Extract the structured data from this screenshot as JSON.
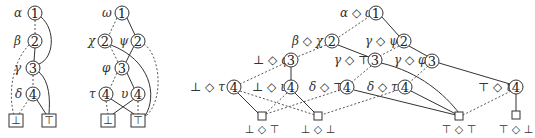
{
  "diagrams": [
    {
      "name": "left",
      "nodes": [
        {
          "id": "l1",
          "num": "1",
          "label": "α"
        },
        {
          "id": "l2",
          "num": "2",
          "label": "β"
        },
        {
          "id": "l3",
          "num": "3",
          "label": "γ"
        },
        {
          "id": "l4",
          "num": "4",
          "label": "δ"
        }
      ],
      "leaves": [
        {
          "id": "lbot",
          "symbol": "⊥"
        },
        {
          "id": "ltop",
          "symbol": "⊤"
        }
      ]
    },
    {
      "name": "middle",
      "nodes": [
        {
          "id": "m1",
          "num": "1",
          "label": "ω"
        },
        {
          "id": "m2a",
          "num": "2",
          "label": "χ"
        },
        {
          "id": "m2b",
          "num": "2",
          "label": "ψ"
        },
        {
          "id": "m3",
          "num": "3",
          "label": "φ"
        },
        {
          "id": "m4a",
          "num": "4",
          "label": "τ"
        },
        {
          "id": "m4b",
          "num": "4",
          "label": "υ"
        }
      ],
      "leaves": [
        {
          "id": "mbot",
          "symbol": "⊥"
        },
        {
          "id": "mtop",
          "symbol": "⊤"
        }
      ]
    },
    {
      "name": "right-product",
      "nodes": [
        {
          "id": "r1",
          "num": "1",
          "label": "α ◇ ω"
        },
        {
          "id": "r2a",
          "num": "2",
          "label": "β ◇ χ"
        },
        {
          "id": "r2b",
          "num": "2",
          "label": "γ ◇ ψ"
        },
        {
          "id": "r3a",
          "num": "3",
          "label": "⊥ ◇ φ"
        },
        {
          "id": "r3b",
          "num": "3",
          "label": "γ ◇ ⊤"
        },
        {
          "id": "r3c",
          "num": "3",
          "label": "γ ◇ φ"
        },
        {
          "id": "r4a",
          "num": "4",
          "label": "⊥ ◇ τ"
        },
        {
          "id": "r4b",
          "num": "4",
          "label": "⊥ ◇ υ"
        },
        {
          "id": "r4c",
          "num": "4",
          "label": "δ ◇ ⊤"
        },
        {
          "id": "r4d",
          "num": "4",
          "label": "δ ◇ τ"
        },
        {
          "id": "r4e",
          "num": "4",
          "label": "⊤ ◇ υ"
        }
      ],
      "leaves": [
        {
          "id": "rbt",
          "label": "⊥ ◇ ⊤"
        },
        {
          "id": "rbb",
          "label": "⊥ ◇ ⊥"
        },
        {
          "id": "rtt",
          "label": "⊤ ◇ ⊤"
        },
        {
          "id": "rtb",
          "label": "⊤ ◇ ⊥"
        }
      ]
    }
  ]
}
